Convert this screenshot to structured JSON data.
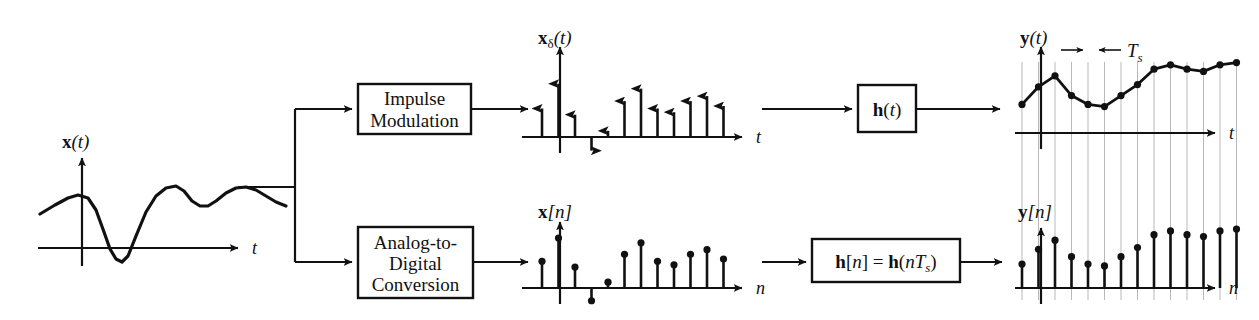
{
  "figure": {
    "stroke_color": "#111111",
    "grid_color": "#b9b9b9",
    "background": "#ffffff"
  },
  "blocks": [
    {
      "id": "impulse-modulation",
      "lines": [
        "Impulse",
        "Modulation"
      ],
      "x": 358,
      "y": 84,
      "w": 113,
      "h": 50
    },
    {
      "id": "analog-to-digital-conversion",
      "lines": [
        "Analog-to-",
        "Digital",
        "Conversion"
      ],
      "x": 358,
      "y": 227,
      "w": 115,
      "h": 71
    },
    {
      "id": "h-of-t",
      "lines": [
        "h(t)"
      ],
      "x": 858,
      "y": 85,
      "w": 58,
      "h": 47
    },
    {
      "id": "h-of-n",
      "lines": [
        "h[n] = h(nTs)"
      ],
      "x": 812,
      "y": 239,
      "w": 148,
      "h": 43
    }
  ],
  "plots": {
    "x_of_t": {
      "label": "x(t)",
      "label_roman": "x",
      "label_italic": "(t)",
      "axis_x_label": "t",
      "axis": {
        "ox": 82,
        "oy": 248,
        "x_end": 238,
        "y_top": 158,
        "x_start": 38
      },
      "curve_points": [
        [
          40,
          214
        ],
        [
          55,
          205
        ],
        [
          68,
          198
        ],
        [
          78,
          195
        ],
        [
          88,
          198
        ],
        [
          96,
          210
        ],
        [
          104,
          232
        ],
        [
          110,
          249
        ],
        [
          116,
          259
        ],
        [
          122,
          262
        ],
        [
          128,
          256
        ],
        [
          136,
          236
        ],
        [
          146,
          212
        ],
        [
          156,
          196
        ],
        [
          166,
          188
        ],
        [
          176,
          186
        ],
        [
          184,
          191
        ],
        [
          192,
          201
        ],
        [
          200,
          206
        ],
        [
          208,
          206
        ],
        [
          216,
          201
        ],
        [
          226,
          193
        ],
        [
          236,
          188
        ],
        [
          246,
          187
        ],
        [
          256,
          190
        ],
        [
          266,
          196
        ],
        [
          276,
          202
        ],
        [
          286,
          206
        ]
      ]
    },
    "x_delta_of_t": {
      "label": "xδ(t)",
      "label_roman": "x",
      "label_sub": "δ",
      "label_italic": "(t)",
      "axis_x_label": "t",
      "axis": {
        "ox": 560,
        "oy": 137,
        "x_end": 742,
        "y_top": 47,
        "x_start": 522
      },
      "sample_spacing": 16.5,
      "first_sample_x": 542,
      "impulse_values": [
        0.46,
        0.86,
        0.36,
        -0.22,
        0.1,
        0.58,
        0.78,
        0.46,
        0.4,
        0.58,
        0.66,
        0.5
      ],
      "count": 12
    },
    "x_of_n": {
      "label": "x[n]",
      "label_roman": "x",
      "label_italic": "[n]",
      "axis_x_label": "n",
      "axis": {
        "ox": 560,
        "oy": 288,
        "x_end": 742,
        "y_top": 222,
        "x_start": 522
      },
      "sample_spacing": 16.5,
      "first_sample_x": 542,
      "stem_values": [
        0.46,
        0.86,
        0.36,
        -0.22,
        0.1,
        0.58,
        0.78,
        0.46,
        0.4,
        0.58,
        0.66,
        0.5
      ],
      "count": 12
    },
    "y_of_t": {
      "label": "y(t)",
      "label_roman": "y",
      "label_italic": "(t)",
      "axis_x_label": "t",
      "ts_label": "Ts",
      "ts_label_italic": "T",
      "ts_label_sub": "s",
      "axis": {
        "ox": 1041,
        "oy": 133,
        "x_end": 1215,
        "y_top": 47,
        "x_start": 1015
      },
      "sample_spacing": 16.5,
      "first_sample_x": 1022,
      "sample_values": [
        0.26,
        0.42,
        0.52,
        0.34,
        0.26,
        0.24,
        0.34,
        0.44,
        0.58,
        0.62,
        0.58,
        0.56,
        0.62,
        0.64
      ],
      "count": 14,
      "ts_bracket": {
        "left": 1083,
        "right": 1099,
        "y": 50
      }
    },
    "y_of_n": {
      "label": "y[n]",
      "label_roman": "y",
      "label_italic": "[n]",
      "axis_x_label": "n",
      "axis": {
        "ox": 1041,
        "oy": 288,
        "x_end": 1215,
        "y_top": 228,
        "x_start": 1015
      },
      "sample_spacing": 16.5,
      "first_sample_x": 1022,
      "stem_values": [
        0.26,
        0.42,
        0.52,
        0.34,
        0.26,
        0.24,
        0.34,
        0.44,
        0.58,
        0.62,
        0.58,
        0.56,
        0.62,
        0.64
      ],
      "count": 14
    }
  },
  "connectors": [
    {
      "id": "split-trunk",
      "from": [
        238,
        187
      ],
      "to": [
        295,
        187
      ]
    },
    {
      "id": "branch-up",
      "from": [
        295,
        187
      ],
      "to": [
        295,
        109
      ]
    },
    {
      "id": "branch-down",
      "from": [
        295,
        187
      ],
      "to": [
        295,
        262
      ]
    },
    {
      "id": "to-impulse-modulation",
      "from": [
        295,
        109
      ],
      "to": [
        352,
        109
      ]
    },
    {
      "id": "to-adc",
      "from": [
        295,
        262
      ],
      "to": [
        352,
        262
      ]
    },
    {
      "id": "impulse-to-plot",
      "from": [
        471,
        109
      ],
      "to": [
        528,
        109
      ]
    },
    {
      "id": "adc-to-plot",
      "from": [
        473,
        262
      ],
      "to": [
        528,
        262
      ]
    },
    {
      "id": "plot-to-h-t",
      "from": [
        762,
        109
      ],
      "to": [
        852,
        109
      ]
    },
    {
      "id": "plot-to-h-n",
      "from": [
        762,
        262
      ],
      "to": [
        806,
        262
      ]
    },
    {
      "id": "h-t-to-out",
      "from": [
        916,
        109
      ],
      "to": [
        1000,
        109
      ]
    },
    {
      "id": "h-n-to-out",
      "from": [
        960,
        262
      ],
      "to": [
        1002,
        262
      ]
    }
  ],
  "gridlines": {
    "top_y": 62,
    "bottom_y": 300,
    "count": 14,
    "first_x": 1022,
    "spacing": 16.5
  }
}
